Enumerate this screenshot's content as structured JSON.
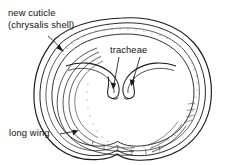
{
  "figure": {
    "background_color": "#ffffff",
    "ink_color": "#1b1b1b",
    "stipple_color": "#6a6a6a",
    "labels": {
      "new_cuticle_line1": "new cuticle",
      "new_cuticle_line2": "(chrysalis shell)",
      "tracheae": "tracheae",
      "long_wing": "long wing"
    },
    "callouts": [
      {
        "name": "new-cuticle-callout",
        "label": "new cuticle (chrysalis shell)",
        "target": "outer shell wall, upper left"
      },
      {
        "name": "tracheae-callout-left",
        "label": "tracheae",
        "target": "left tracheal hook tip, center"
      },
      {
        "name": "tracheae-callout-right",
        "label": "tracheae",
        "target": "right tracheal hook tip, center"
      },
      {
        "name": "long-wing-callout",
        "label": "long wing",
        "target": "layered wing sheets, lower left"
      }
    ],
    "parts": [
      {
        "name": "outer-cuticle-outline",
        "description": "outermost chrysalis shell contour, rounded oval with notched base"
      },
      {
        "name": "inner-cuticle-outline",
        "description": "second contour just inside the shell wall"
      },
      {
        "name": "body-wall-outline",
        "description": "inner body wall contour enclosing the central cavity"
      },
      {
        "name": "tracheae-left",
        "description": "left tracheal tube curving inward and hooking down at center"
      },
      {
        "name": "tracheae-right",
        "description": "right tracheal tube curving inward and hooking down at center"
      },
      {
        "name": "long-wing-layers",
        "description": "stack of long parallel wing sheets along the left and lower margin"
      },
      {
        "name": "abdominal-segments",
        "description": "segment divisions along the lower shell margin"
      },
      {
        "name": "stippling",
        "description": "fine dotted shading along the inner shell wall"
      }
    ]
  }
}
